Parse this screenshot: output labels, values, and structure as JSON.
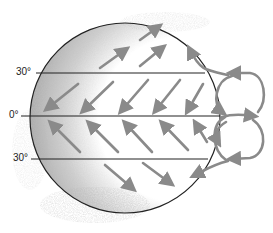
{
  "diagram": {
    "type": "global-wind-circulation",
    "labels": {
      "lat_30n": "30°",
      "equator": "0°",
      "lat_30s": "30°"
    },
    "colors": {
      "outline": "#222222",
      "arrow": "#8a8a8a",
      "shade": "#b8b8b8"
    }
  }
}
